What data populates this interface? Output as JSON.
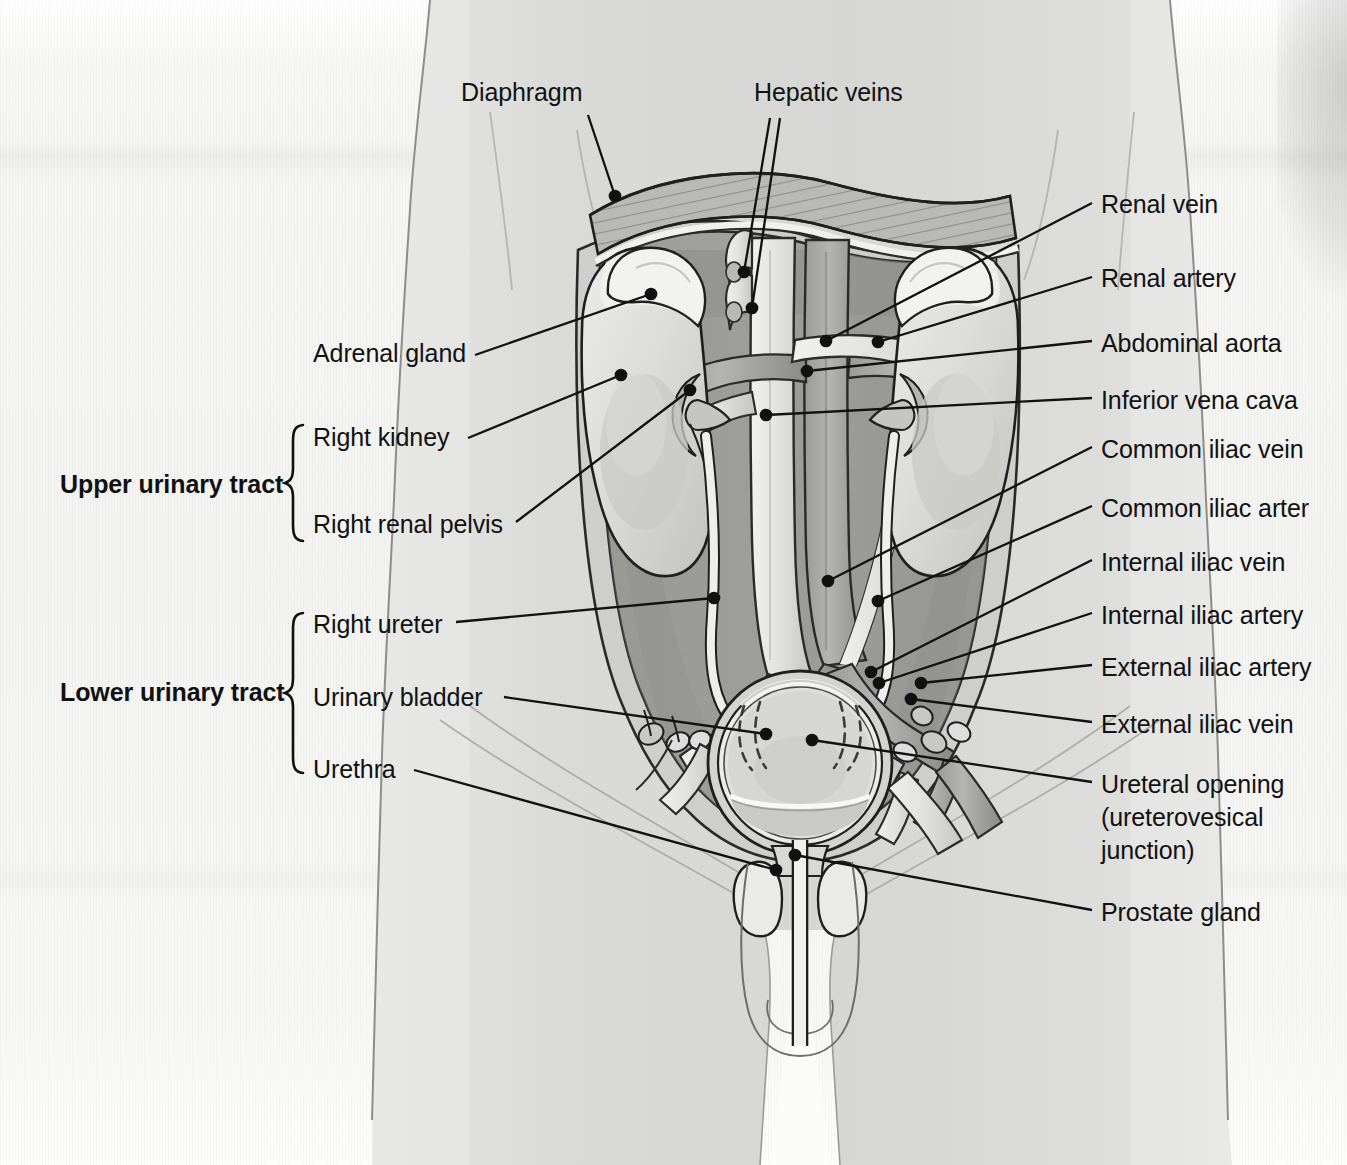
{
  "figure": {
    "view": "anterior abdominal / pelvic cross-section"
  },
  "groups": [
    {
      "name": "Upper urinary tract",
      "label": "Upper urinary tract",
      "members": [
        "Right kidney",
        "Right renal pelvis"
      ]
    },
    {
      "name": "Lower urinary tract",
      "label": "Lower urinary tract",
      "members": [
        "Right ureter",
        "Urinary bladder",
        "Urethra"
      ]
    }
  ],
  "labels": {
    "diaphragm": "Diaphragm",
    "hepatic_veins": "Hepatic veins",
    "adrenal_gland": "Adrenal gland",
    "right_kidney": "Right kidney",
    "right_renal_pelvis": "Right renal pelvis",
    "right_ureter": "Right ureter",
    "urinary_bladder": "Urinary bladder",
    "urethra": "Urethra",
    "upper_urinary_tract": "Upper urinary tract",
    "lower_urinary_tract": "Lower urinary tract",
    "renal_vein": "Renal vein",
    "renal_artery": "Renal artery",
    "abdominal_aorta": "Abdominal aorta",
    "inferior_vena_cava": "Inferior vena cava",
    "common_iliac_vein": "Common iliac vein",
    "common_iliac_artery": "Common iliac arter",
    "internal_iliac_vein": "Internal iliac vein",
    "internal_iliac_artery": "Internal iliac artery",
    "external_iliac_artery": "External iliac artery",
    "external_iliac_vein": "External iliac vein",
    "ureteral_opening_l1": "Ureteral opening",
    "ureteral_opening_l2": "(ureterovesical",
    "ureteral_opening_l3": "junction)",
    "prostate_gland": "Prostate gland"
  },
  "colors": {
    "paper": "#f4f4f2",
    "body_fill": "#dcdcda",
    "body_fill_dark": "#cfcfcd",
    "cavity_wall": "#b6b6b4",
    "cavity_inner": "#9d9d9b",
    "cavity_inner_dark": "#8e8e8c",
    "organ_light": "#eeeeec",
    "kidney": "#d8d8d6",
    "kidney_shadow": "#c0c0be",
    "vessel_light": "#e9e9e7",
    "vessel_dark": "#8a8a88",
    "vessel_mid": "#a8a8a6",
    "outline": "#1f1f1f",
    "leader": "#111111",
    "text": "#111111"
  }
}
